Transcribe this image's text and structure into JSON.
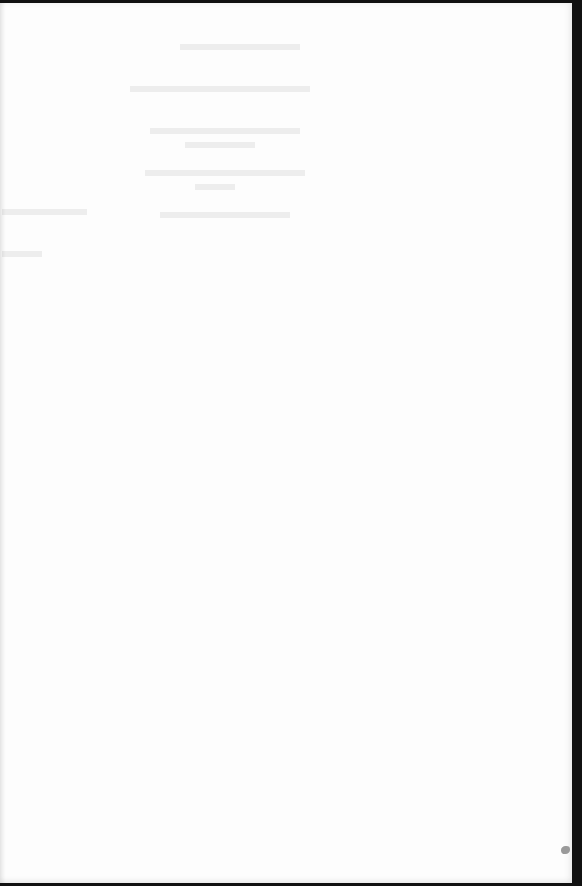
{
  "document": {
    "type": "scanned-page",
    "content": "",
    "notes": {
      "show_through": "faint illegible bleed-through from reverse side near top of page",
      "border": "dark scan border along top, right and bottom edges",
      "artifact": "small gray blot on right edge near bottom"
    }
  },
  "colors": {
    "page": "#fdfdfd",
    "border": "#111111",
    "blot": "#9a9a9a"
  }
}
